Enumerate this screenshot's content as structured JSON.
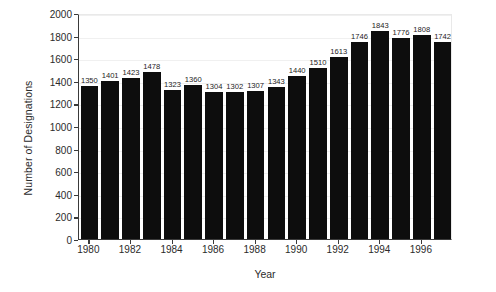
{
  "chart_data": {
    "type": "bar",
    "title": "",
    "xlabel": "Year",
    "ylabel": "Number of Designations",
    "categories": [
      "1980",
      "1981",
      "1982",
      "1983",
      "1984",
      "1985",
      "1986",
      "1987",
      "1988",
      "1989",
      "1990",
      "1991",
      "1992",
      "1993",
      "1994",
      "1995",
      "1996",
      "1997"
    ],
    "values": [
      1350,
      1401,
      1423,
      1478,
      1323,
      1360,
      1304,
      1302,
      1307,
      1343,
      1440,
      1510,
      1613,
      1746,
      1843,
      1776,
      1808,
      1742
    ],
    "value_labels": [
      "1350",
      "1401",
      "1423",
      "1478",
      "1323",
      "1360",
      "1304",
      "1302",
      "1307",
      "1343",
      "1440",
      "1510",
      "1613",
      "1746",
      "1843",
      "1776",
      "1808",
      "1742"
    ],
    "ylim": [
      0,
      2000
    ],
    "yticks": [
      0,
      200,
      400,
      600,
      800,
      1000,
      1200,
      1400,
      1600,
      1800,
      2000
    ],
    "ytick_labels": [
      "0",
      "200",
      "400",
      "600",
      "800",
      "1000",
      "1200",
      "1400",
      "1600",
      "1800",
      "2000"
    ],
    "xtick_labels": [
      "1980",
      "1982",
      "1984",
      "1986",
      "1988",
      "1990",
      "1992",
      "1994",
      "1996"
    ],
    "xtick_categories": [
      "1980",
      "1982",
      "1984",
      "1986",
      "1988",
      "1990",
      "1992",
      "1994",
      "1996"
    ],
    "grid": true,
    "grid_axis": "y",
    "legend": false,
    "bar_color": "#0d0d0d",
    "axis_color": "#3a3a3a",
    "grid_color": "#f0f0f0",
    "background": "#ffffff",
    "show_value_labels": true
  }
}
